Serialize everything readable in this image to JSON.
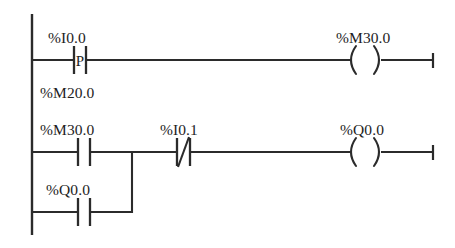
{
  "diagram": {
    "kind": "plc-ladder-logic",
    "background_color": "#ffffff",
    "line_color": "#2b2b2b",
    "text_color": "#1e1e1e",
    "left_rail": {
      "x": 32,
      "y_top": 14,
      "y_bottom": 235
    },
    "rungs": [
      {
        "id": "rung-1",
        "y": 60,
        "end_tick_x": 433,
        "elements": [
          {
            "type": "contact-positive-edge",
            "symbol": "-|P|-",
            "inner_letter": "P",
            "label": "%I0.0",
            "label_x": 48,
            "label_y": 43,
            "x_left": 74,
            "x_right": 86
          },
          {
            "type": "coil",
            "symbol": "-( )-",
            "label": "%M30.0",
            "label_x": 336,
            "label_y": 43,
            "x_left": 352,
            "x_right": 378
          }
        ]
      },
      {
        "id": "rung-2",
        "y": 152,
        "end_tick_x": 433,
        "elements": [
          {
            "type": "contact-normally-open",
            "symbol": "-| |-",
            "label": "%M30.0",
            "label_x": 40,
            "label_y": 135,
            "x_left": 78,
            "x_right": 90
          },
          {
            "type": "contact-normally-closed",
            "symbol": "-|/|-",
            "label": "%I0.1",
            "label_x": 160,
            "label_y": 135,
            "x_left": 177,
            "x_right": 190
          },
          {
            "type": "coil",
            "symbol": "-( )-",
            "label": "%Q0.0",
            "label_x": 340,
            "label_y": 135,
            "x_left": 352,
            "x_right": 378
          }
        ]
      },
      {
        "id": "rung-3-branch",
        "y": 212,
        "branch_return_x": 132,
        "elements": [
          {
            "type": "contact-normally-open",
            "symbol": "-| |-",
            "label": "%Q0.0",
            "label_x": 46,
            "label_y": 195,
            "x_left": 78,
            "x_right": 90
          }
        ]
      }
    ],
    "standalone_labels": [
      {
        "id": "label-m20",
        "text": "%M20.0",
        "x": 40,
        "y": 98
      }
    ]
  }
}
